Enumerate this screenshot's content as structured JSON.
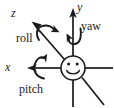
{
  "figure": {
    "kind": "rotation-axes-diagram",
    "background_color": "#ffffff",
    "ink_color": "#1b1b1b",
    "width": 114,
    "height": 108
  },
  "axes": [
    {
      "id": "z",
      "label": "z",
      "direction": "up-left diagonal",
      "arrow": true,
      "label_position": {
        "x": 11,
        "y": 7
      }
    },
    {
      "id": "y",
      "label": "y",
      "direction": "up vertical",
      "arrow": true,
      "label_position": {
        "x": 77,
        "y": 1
      }
    },
    {
      "id": "x",
      "label": "x",
      "direction": "left horizontal",
      "arrow": true,
      "label_position": {
        "x": 5,
        "y": 61
      }
    }
  ],
  "rotations": [
    {
      "id": "roll",
      "label": "roll",
      "about_axis": "z",
      "label_position": {
        "x": 16,
        "y": 32
      }
    },
    {
      "id": "yaw",
      "label": "yaw",
      "about_axis": "y",
      "label_position": {
        "x": 81,
        "y": 20
      }
    },
    {
      "id": "pitch",
      "label": "pitch",
      "about_axis": "x",
      "label_position": {
        "x": 19,
        "y": 83
      }
    }
  ],
  "origin_marker": {
    "type": "smiley-face",
    "center": {
      "x": 73,
      "y": 68
    },
    "radius": 12,
    "features": [
      "left-eye",
      "right-eye",
      "smile-mouth"
    ]
  }
}
